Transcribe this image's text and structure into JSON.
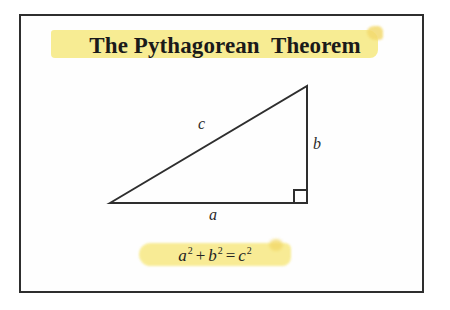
{
  "slide": {
    "background_color": "#ffffff",
    "frame_border_color": "#2e2e2e",
    "highlight_color": "#f7ec8f",
    "ink_color": "#2b2b2b"
  },
  "title": {
    "text": "The Pythagorean  Theorem"
  },
  "figure": {
    "name": "right-triangle-diagram",
    "vertices": {
      "left": [
        91,
        189
      ],
      "right_angle": [
        288,
        189
      ],
      "apex": [
        288,
        72
      ]
    },
    "right_angle_marker_size": 13,
    "labels": {
      "hypotenuse": "c",
      "vertical_leg": "b",
      "horizontal_leg": "a"
    }
  },
  "formula": {
    "terms": {
      "a_base": "a",
      "a_exp": "2",
      "plus": "+",
      "b_base": "b",
      "b_exp": "2",
      "equals": "=",
      "c_base": "c",
      "c_exp": "2"
    },
    "plain_text": "a2 + b2 = c2"
  }
}
